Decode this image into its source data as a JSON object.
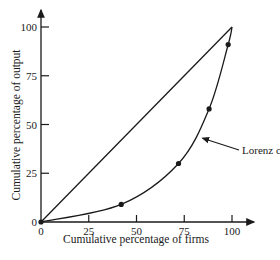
{
  "chart_data": {
    "type": "line",
    "title": "",
    "xlabel": "Cumulative percentage of firms",
    "ylabel": "Cumulative percentage of output",
    "xlim": [
      0,
      100
    ],
    "ylim": [
      0,
      100
    ],
    "x_ticks": [
      0,
      25,
      50,
      75,
      100
    ],
    "y_ticks": [
      0,
      25,
      50,
      75,
      100
    ],
    "x_tick_labels": [
      "0",
      "25",
      "50",
      "75",
      "100"
    ],
    "y_tick_labels": [
      "0",
      "25",
      "50",
      "75",
      "100"
    ],
    "grid": false,
    "legend": null,
    "series": [
      {
        "name": "Line of equality",
        "style": "line",
        "x": [
          0,
          100
        ],
        "y": [
          0,
          100
        ]
      },
      {
        "name": "Lorenz curve",
        "style": "curve-with-markers",
        "x": [
          0,
          42,
          72,
          88,
          98,
          100
        ],
        "y": [
          0,
          9,
          30,
          58,
          91,
          100
        ]
      }
    ],
    "annotations": [
      {
        "text": "Lorenz curve",
        "points_to": [
          83,
          44
        ]
      }
    ]
  }
}
